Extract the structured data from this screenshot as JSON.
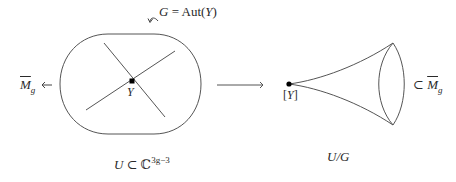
{
  "diagram": {
    "group_label": {
      "lhs": "G",
      "eq": " = ",
      "rhs": "Aut",
      "arg_open": "(",
      "arg": "Y",
      "arg_close": ")"
    },
    "left_space": {
      "point_label": "Y",
      "maps_to_label": {
        "symbol": "M",
        "subscript": "g",
        "arrow": "←"
      },
      "caption": {
        "lhs": "U",
        "rel": " ⊂ ",
        "field": "ℂ",
        "exponent": "3g−3"
      }
    },
    "quotient_arrow": "long-right-arrow",
    "right_space": {
      "point_label": {
        "open": "[",
        "sym": "Y",
        "close": "]"
      },
      "inclusion_label": {
        "rel": "⊂ ",
        "symbol": "M",
        "subscript": "g"
      },
      "caption": "U/G"
    },
    "colors": {
      "stroke": "#555555",
      "text": "#2a2a2a",
      "point": "#000000"
    }
  }
}
